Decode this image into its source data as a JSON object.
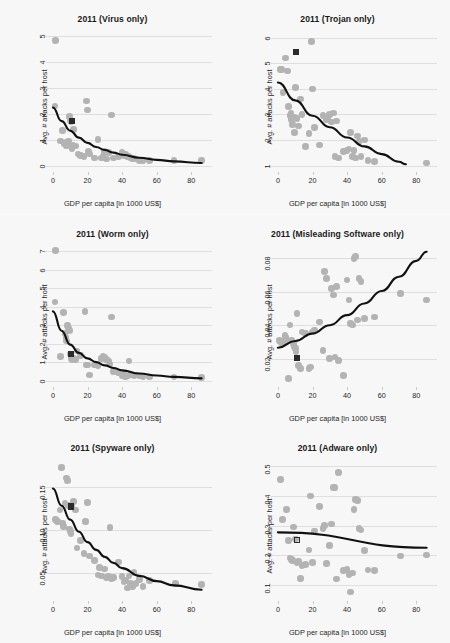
{
  "figure": {
    "shared_xlabel": "GDP per capita [in 1000 US$]",
    "shared_ylabel": "Avg. # attacks per host",
    "grid_rows": 3,
    "grid_cols": 2,
    "colors": {
      "point": "#b3b3b3",
      "highlight_marker": "#2b2b2b",
      "fit_line": "#111111",
      "gridline": "#dedede",
      "panel_background": "#f7f7f7",
      "title_text": "#1a1a1a"
    }
  },
  "chart_data": [
    {
      "type": "scatter",
      "title": "2011 (Virus only)",
      "xlabel": "GDP per capita [in 1000 US$]",
      "ylabel": "Avg. # attacks per host",
      "xlim": [
        -4,
        92
      ],
      "ylim": [
        -0.25,
        5.25
      ],
      "xticks": [
        0,
        20,
        40,
        60,
        80
      ],
      "yticks": [
        0,
        1,
        2,
        3,
        4,
        5
      ],
      "grid": true,
      "legend": "none",
      "x": [
        1.5,
        1.2,
        4.5,
        5.5,
        6.5,
        7.5,
        8.0,
        8.5,
        9.0,
        9.5,
        10.0,
        10.5,
        11.0,
        11.5,
        12.0,
        13.0,
        14.5,
        16.0,
        18.0,
        19.5,
        20.0,
        20.5,
        21.0,
        24.0,
        26.0,
        28.0,
        29.0,
        30.0,
        31.0,
        32.0,
        34.0,
        35.0,
        38.0,
        40.0,
        41.0,
        42.0,
        43.0,
        44.0,
        45.0,
        46.0,
        47.0,
        48.0,
        50.0,
        52.0,
        56.0,
        70.0,
        86.0
      ],
      "y": [
        4.85,
        2.3,
        0.95,
        1.35,
        0.85,
        0.9,
        0.75,
        0.8,
        0.95,
        1.9,
        1.75,
        1.7,
        0.65,
        0.8,
        1.4,
        0.75,
        0.45,
        0.4,
        0.35,
        2.5,
        2.15,
        0.55,
        0.45,
        0.3,
        1.0,
        0.3,
        0.35,
        0.55,
        0.25,
        0.5,
        1.95,
        0.3,
        0.35,
        0.5,
        0.4,
        0.45,
        0.35,
        0.35,
        0.3,
        0.25,
        0.3,
        0.25,
        0.2,
        0.2,
        0.2,
        0.2,
        0.2
      ],
      "highlight_point": {
        "x": 11.0,
        "y": 1.72,
        "marker": "filled-square"
      },
      "fit": {
        "kind": "exponential-decay",
        "points": [
          [
            0,
            2.25
          ],
          [
            5,
            1.72
          ],
          [
            10,
            1.35
          ],
          [
            15,
            1.08
          ],
          [
            20,
            0.88
          ],
          [
            25,
            0.72
          ],
          [
            30,
            0.6
          ],
          [
            35,
            0.5
          ],
          [
            40,
            0.42
          ],
          [
            50,
            0.3
          ],
          [
            60,
            0.22
          ],
          [
            70,
            0.16
          ],
          [
            86,
            0.1
          ]
        ]
      }
    },
    {
      "type": "scatter",
      "title": "2011 (Trojan only)",
      "xlabel": "GDP per capita [in 1000 US$]",
      "ylabel": "Avg. # attacks per host",
      "xlim": [
        -4,
        92
      ],
      "ylim": [
        0.75,
        6.3
      ],
      "xticks": [
        0,
        20,
        40,
        60,
        80
      ],
      "yticks": [
        1,
        2,
        3,
        4,
        5,
        6
      ],
      "grid": true,
      "legend": "none",
      "x": [
        1.5,
        2.0,
        3.0,
        4.5,
        5.5,
        6.0,
        7.0,
        7.5,
        8.0,
        8.5,
        9.0,
        9.5,
        10.0,
        11.0,
        12.0,
        13.0,
        14.0,
        16.0,
        18.0,
        19.5,
        20.0,
        21.0,
        24.0,
        26.0,
        28.0,
        29.0,
        30.0,
        31.0,
        32.0,
        33.0,
        34.0,
        35.0,
        38.0,
        40.0,
        41.0,
        42.0,
        43.0,
        44.0,
        45.0,
        46.0,
        47.0,
        48.0,
        50.0,
        52.0,
        56.0,
        86.0
      ],
      "y": [
        4.75,
        4.75,
        3.85,
        5.2,
        4.7,
        3.3,
        2.95,
        3.05,
        2.8,
        2.6,
        2.9,
        2.3,
        4.05,
        2.85,
        2.55,
        3.6,
        3.0,
        1.75,
        2.25,
        5.85,
        4.0,
        2.5,
        1.8,
        2.95,
        2.8,
        2.85,
        3.0,
        2.7,
        3.05,
        1.35,
        2.75,
        1.3,
        1.55,
        1.6,
        1.65,
        2.3,
        1.35,
        1.6,
        1.3,
        2.15,
        1.95,
        1.35,
        2.0,
        1.2,
        1.15,
        1.1
      ],
      "highlight_point": {
        "x": 10.5,
        "y": 5.45,
        "marker": "filled-square"
      },
      "fit": {
        "kind": "exponential-decay",
        "points": [
          [
            0,
            4.25
          ],
          [
            10,
            3.55
          ],
          [
            20,
            2.95
          ],
          [
            30,
            2.5
          ],
          [
            40,
            2.1
          ],
          [
            50,
            1.75
          ],
          [
            60,
            1.45
          ],
          [
            70,
            1.15
          ],
          [
            74,
            1.05
          ]
        ]
      }
    },
    {
      "type": "scatter",
      "title": "2011 (Worm only)",
      "xlabel": "GDP per capita [in 1000 US$]",
      "ylabel": "Avg. # attacks per host",
      "xlim": [
        -4,
        92
      ],
      "ylim": [
        -0.35,
        7.35
      ],
      "xticks": [
        0,
        20,
        40,
        60,
        80
      ],
      "yticks": [
        0,
        1,
        2,
        3,
        4,
        5,
        6,
        7
      ],
      "grid": true,
      "legend": "none",
      "x": [
        1.5,
        1.2,
        4.5,
        6.0,
        7.0,
        7.5,
        8.0,
        8.5,
        9.0,
        9.5,
        10.0,
        10.5,
        11.0,
        12.0,
        13.0,
        14.0,
        16.0,
        18.5,
        19.5,
        20.0,
        21.0,
        24.0,
        26.0,
        28.0,
        29.0,
        30.0,
        31.0,
        32.0,
        33.0,
        34.0,
        35.0,
        38.0,
        40.0,
        41.0,
        42.0,
        43.0,
        44.0,
        45.0,
        46.0,
        47.0,
        48.0,
        50.0,
        52.0,
        56.0,
        70.0,
        86.0
      ],
      "y": [
        7.05,
        4.25,
        1.3,
        3.7,
        2.55,
        2.35,
        2.15,
        3.0,
        2.85,
        2.7,
        1.45,
        1.2,
        1.15,
        1.2,
        1.15,
        1.6,
        1.35,
        3.75,
        0.85,
        0.85,
        0.3,
        0.85,
        0.8,
        1.2,
        1.3,
        1.25,
        1.15,
        1.05,
        0.9,
        3.45,
        0.5,
        0.4,
        0.25,
        0.35,
        0.2,
        0.25,
        1.05,
        0.3,
        0.3,
        0.25,
        0.3,
        0.25,
        0.2,
        0.2,
        0.2,
        0.15
      ],
      "highlight_point": {
        "x": 10.5,
        "y": 1.45,
        "marker": "filled-square"
      },
      "fit": {
        "kind": "exponential-decay",
        "points": [
          [
            0,
            3.75
          ],
          [
            5,
            2.7
          ],
          [
            10,
            1.95
          ],
          [
            15,
            1.5
          ],
          [
            20,
            1.2
          ],
          [
            25,
            1.0
          ],
          [
            30,
            0.82
          ],
          [
            35,
            0.68
          ],
          [
            40,
            0.55
          ],
          [
            50,
            0.38
          ],
          [
            60,
            0.27
          ],
          [
            70,
            0.2
          ],
          [
            86,
            0.12
          ]
        ]
      }
    },
    {
      "type": "scatter",
      "title": "2011 (Misleading Software only)",
      "xlabel": "GDP per capita [in 1000 US$]",
      "ylabel": "Avg. # attacks per host",
      "xlim": [
        -4,
        92
      ],
      "ylim": [
        0.003,
        0.088
      ],
      "xticks": [
        0,
        20,
        40,
        60,
        80
      ],
      "yticks": [
        0.02,
        0.04,
        0.06,
        0.08
      ],
      "ytick_labels": [
        "0.02",
        "0.04",
        "0.06",
        "0.08"
      ],
      "grid": true,
      "legend": "none",
      "x": [
        1.0,
        1.5,
        2.5,
        4.0,
        4.5,
        5.0,
        6.0,
        7.0,
        8.0,
        9.0,
        9.5,
        10.0,
        10.5,
        11.0,
        12.0,
        13.0,
        14.0,
        16.0,
        18.0,
        19.0,
        20.0,
        21.0,
        24.0,
        26.0,
        27.0,
        28.0,
        30.0,
        31.0,
        32.0,
        33.0,
        34.0,
        35.0,
        38.0,
        40.0,
        41.0,
        42.0,
        43.0,
        44.0,
        45.0,
        46.0,
        47.0,
        48.0,
        50.0,
        56.0,
        71.0,
        86.0
      ],
      "y": [
        0.031,
        0.03,
        0.029,
        0.034,
        0.033,
        0.031,
        0.008,
        0.04,
        0.031,
        0.029,
        0.027,
        0.026,
        0.024,
        0.047,
        0.016,
        0.014,
        0.036,
        0.035,
        0.014,
        0.015,
        0.036,
        0.037,
        0.042,
        0.025,
        0.072,
        0.068,
        0.02,
        0.062,
        0.058,
        0.021,
        0.063,
        0.019,
        0.01,
        0.067,
        0.055,
        0.041,
        0.04,
        0.08,
        0.081,
        0.043,
        0.068,
        0.066,
        0.044,
        0.045,
        0.059,
        0.055
      ],
      "highlight_point": {
        "x": 11.0,
        "y": 0.0205,
        "marker": "filled-square"
      },
      "fit": {
        "kind": "exponential-growth",
        "points": [
          [
            0,
            0.0265
          ],
          [
            10,
            0.0305
          ],
          [
            20,
            0.035
          ],
          [
            30,
            0.04
          ],
          [
            40,
            0.046
          ],
          [
            50,
            0.053
          ],
          [
            60,
            0.0605
          ],
          [
            70,
            0.069
          ],
          [
            80,
            0.0785
          ],
          [
            86,
            0.084
          ]
        ]
      }
    },
    {
      "type": "scatter",
      "title": "2011 (Spyware only)",
      "xlabel": "GDP per capita [in 1000 US$]",
      "ylabel": "Avg. # attacks per host",
      "xlim": [
        -4,
        92
      ],
      "ylim": [
        0.018,
        0.182
      ],
      "xticks": [
        0,
        20,
        40,
        60,
        80
      ],
      "yticks": [
        0.05,
        0.1,
        0.15
      ],
      "ytick_labels": [
        "0.05",
        "0.10",
        "0.15"
      ],
      "grid": true,
      "legend": "none",
      "x": [
        1.5,
        2.5,
        4.0,
        5.0,
        5.5,
        6.0,
        7.0,
        8.0,
        8.5,
        9.0,
        9.5,
        10.0,
        10.5,
        11.0,
        12.0,
        13.0,
        14.0,
        16.0,
        18.0,
        19.0,
        20.0,
        21.0,
        24.0,
        26.0,
        27.0,
        28.0,
        30.0,
        31.0,
        32.0,
        33.0,
        34.0,
        35.0,
        38.0,
        40.0,
        41.0,
        42.0,
        43.0,
        44.0,
        45.0,
        46.0,
        47.0,
        48.0,
        50.0,
        52.0,
        56.0,
        71.0,
        86.0
      ],
      "y": [
        0.112,
        0.11,
        0.123,
        0.172,
        0.108,
        0.104,
        0.131,
        0.16,
        0.157,
        0.128,
        0.101,
        0.098,
        0.096,
        0.127,
        0.133,
        0.123,
        0.079,
        0.088,
        0.073,
        0.11,
        0.132,
        0.07,
        0.065,
        0.048,
        0.057,
        0.047,
        0.055,
        0.045,
        0.046,
        0.103,
        0.044,
        0.045,
        0.063,
        0.046,
        0.04,
        0.042,
        0.033,
        0.047,
        0.038,
        0.035,
        0.051,
        0.038,
        0.043,
        0.035,
        0.042,
        0.038,
        0.037
      ],
      "highlight_point": {
        "x": 10.5,
        "y": 0.127,
        "marker": "filled-square"
      },
      "fit": {
        "kind": "exponential-decay",
        "points": [
          [
            0,
            0.148
          ],
          [
            5,
            0.128
          ],
          [
            10,
            0.112
          ],
          [
            15,
            0.098
          ],
          [
            20,
            0.086
          ],
          [
            25,
            0.077
          ],
          [
            30,
            0.069
          ],
          [
            35,
            0.062
          ],
          [
            40,
            0.056
          ],
          [
            50,
            0.047
          ],
          [
            60,
            0.041
          ],
          [
            70,
            0.036
          ],
          [
            86,
            0.031
          ]
        ]
      }
    },
    {
      "type": "scatter",
      "title": "2011 (Adware only)",
      "xlabel": "GDP per capita [in 1000 US$]",
      "ylabel": "Avg. # attacks per host",
      "xlim": [
        -4,
        92
      ],
      "ylim": [
        0.045,
        0.525
      ],
      "xticks": [
        0,
        20,
        40,
        60,
        80
      ],
      "yticks": [
        0.1,
        0.2,
        0.3,
        0.4,
        0.5
      ],
      "ytick_labels": [
        "0.1",
        "0.2",
        "0.3",
        "0.4",
        "0.5"
      ],
      "grid": true,
      "legend": "none",
      "x": [
        1.5,
        2.5,
        5.0,
        6.0,
        7.0,
        8.0,
        8.5,
        9.0,
        10.0,
        11.0,
        12.0,
        13.0,
        14.0,
        16.0,
        18.0,
        19.0,
        20.0,
        21.0,
        24.0,
        26.0,
        27.0,
        28.0,
        30.0,
        31.0,
        32.0,
        33.0,
        34.0,
        35.0,
        38.0,
        40.0,
        41.0,
        42.0,
        43.0,
        44.0,
        45.0,
        46.0,
        47.0,
        48.0,
        50.0,
        52.0,
        56.0,
        71.0,
        86.0
      ],
      "y": [
        0.455,
        0.32,
        0.355,
        0.25,
        0.19,
        0.185,
        0.182,
        0.295,
        0.255,
        0.175,
        0.18,
        0.122,
        0.165,
        0.168,
        0.218,
        0.4,
        0.175,
        0.282,
        0.365,
        0.29,
        0.3,
        0.172,
        0.232,
        0.305,
        0.428,
        0.428,
        0.12,
        0.48,
        0.148,
        0.152,
        0.135,
        0.075,
        0.14,
        0.355,
        0.388,
        0.385,
        0.29,
        0.285,
        0.215,
        0.15,
        0.148,
        0.197,
        0.2
      ],
      "highlight_point": {
        "x": 11.0,
        "y": 0.252,
        "marker": "open-square"
      },
      "fit": {
        "kind": "linear",
        "points": [
          [
            0,
            0.277
          ],
          [
            86,
            0.225
          ]
        ]
      }
    }
  ]
}
